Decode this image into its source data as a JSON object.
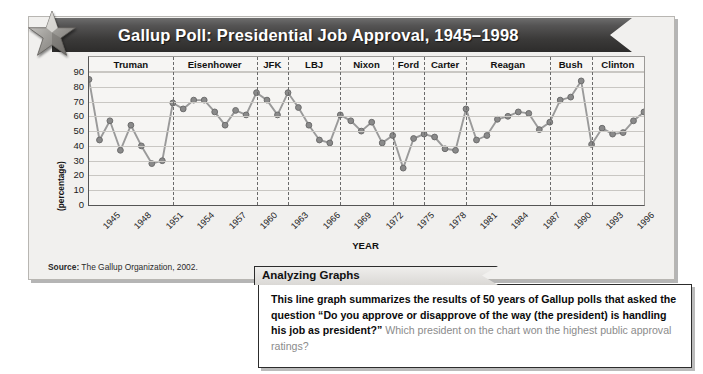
{
  "banner": {
    "title": "Gallup Poll: Presidential Job Approval, 1945–1998",
    "icon": "star-icon",
    "color": "#3b3a39"
  },
  "source": {
    "label": "Source:",
    "text": " The Gallup Organization, 2002."
  },
  "callout": {
    "tab_label": "Analyzing Graphs",
    "body_bold": "This line graph summarizes the results of 50 years of Gallup polls that asked the question “Do you approve or disapprove of the way (the president) is handling his job as president?”",
    "body_question": " Which president on the chart won the highest public approval ratings?"
  },
  "chart_data": {
    "type": "line",
    "title": "Gallup Poll: Presidential Job Approval, 1945–1998",
    "xlabel": "YEAR",
    "ylabel": "JOB APPROVAL (percentage)",
    "ylabel_main": "JOB APPROVAL",
    "ylabel_unit": "(percentage)",
    "ylim": [
      0,
      90
    ],
    "yticks": [
      90,
      80,
      70,
      60,
      50,
      40,
      30,
      20,
      10,
      0
    ],
    "xlim": [
      1945,
      1998
    ],
    "xticks": [
      1945,
      1948,
      1951,
      1954,
      1957,
      1960,
      1963,
      1966,
      1969,
      1972,
      1975,
      1978,
      1981,
      1984,
      1987,
      1990,
      1993,
      1996
    ],
    "grid": true,
    "legend": "none",
    "marker_color": "#8a8a8a",
    "line_color": "#9a9a9a",
    "x": [
      1945,
      1946,
      1947,
      1948,
      1949,
      1950,
      1951,
      1952,
      1953,
      1954,
      1955,
      1956,
      1957,
      1958,
      1959,
      1960,
      1961,
      1962,
      1963,
      1964,
      1965,
      1966,
      1967,
      1968,
      1969,
      1970,
      1971,
      1972,
      1973,
      1974,
      1975,
      1976,
      1977,
      1978,
      1979,
      1980,
      1981,
      1982,
      1983,
      1984,
      1985,
      1986,
      1987,
      1988,
      1989,
      1990,
      1991,
      1992,
      1993,
      1994,
      1995,
      1996,
      1997,
      1998
    ],
    "values": [
      85,
      44,
      57,
      37,
      54,
      40,
      28,
      30,
      69,
      65,
      71,
      71,
      63,
      54,
      64,
      61,
      76,
      71,
      61,
      76,
      66,
      54,
      44,
      42,
      61,
      57,
      50,
      56,
      42,
      47,
      25,
      45,
      48,
      46,
      38,
      37,
      65,
      44,
      47,
      58,
      60,
      63,
      62,
      51,
      56,
      71,
      73,
      84,
      41,
      52,
      48,
      49,
      57,
      63
    ],
    "bands": [
      {
        "president": "Truman",
        "start": 1945,
        "end": 1953
      },
      {
        "president": "Eisenhower",
        "start": 1953,
        "end": 1961
      },
      {
        "president": "JFK",
        "start": 1961,
        "end": 1964
      },
      {
        "president": "LBJ",
        "start": 1964,
        "end": 1969
      },
      {
        "president": "Nixon",
        "start": 1969,
        "end": 1974
      },
      {
        "president": "Ford",
        "start": 1974,
        "end": 1977
      },
      {
        "president": "Carter",
        "start": 1977,
        "end": 1981
      },
      {
        "president": "Reagan",
        "start": 1981,
        "end": 1989
      },
      {
        "president": "Bush",
        "start": 1989,
        "end": 1993
      },
      {
        "president": "Clinton",
        "start": 1993,
        "end": 1998
      }
    ]
  }
}
